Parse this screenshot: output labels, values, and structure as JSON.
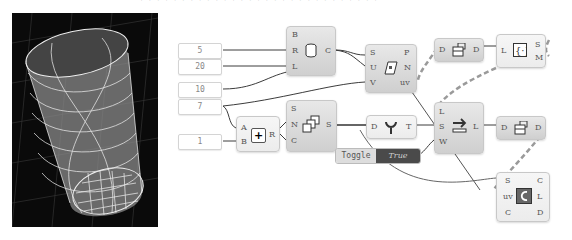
{
  "header": {
    "clipped_caption": "· · · · · · ·  ·  · · · · · · · · · · · · · · · · · · · · ·"
  },
  "viewport": {
    "label": "3D preview",
    "background": "#0a0a0a",
    "wire_color": "#e6e6e6"
  },
  "number_inputs": [
    {
      "value": "5"
    },
    {
      "value": "20"
    },
    {
      "value": "10"
    },
    {
      "value": "7"
    },
    {
      "value": "1"
    }
  ],
  "components": {
    "cylinder": {
      "inputs": [
        "B",
        "R",
        "L"
      ],
      "outputs": [
        "C"
      ],
      "icon": "cylinder-icon"
    },
    "surface_divide": {
      "inputs": [
        "S",
        "U",
        "V"
      ],
      "outputs": [
        "P",
        "N",
        "uv"
      ],
      "icon": "divide-surface-icon"
    },
    "addition": {
      "inputs": [
        "A",
        "B"
      ],
      "outputs": [
        "R"
      ],
      "icon": "plus-icon"
    },
    "series": {
      "inputs": [
        "S",
        "N",
        "C"
      ],
      "outputs": [
        "S"
      ],
      "icon": "series-icon"
    },
    "graft": {
      "inputs": [
        "D"
      ],
      "outputs": [
        "T"
      ],
      "icon": "graft-tree-icon"
    },
    "shift_list": {
      "inputs": [
        "L",
        "S",
        "W"
      ],
      "outputs": [
        "L"
      ],
      "icon": "shift-list-icon"
    },
    "flip_matrix_top": {
      "inputs": [
        "D"
      ],
      "outputs": [
        "D"
      ],
      "icon": "flip-matrix-icon"
    },
    "list_length": {
      "inputs": [
        "L"
      ],
      "outputs": [
        "S",
        "M"
      ],
      "icon": "list-brackets-icon"
    },
    "flip_matrix_mid": {
      "inputs": [
        "D"
      ],
      "outputs": [
        "D"
      ],
      "icon": "flip-matrix-icon"
    },
    "curve_on_surface": {
      "inputs": [
        "S",
        "uv",
        "C"
      ],
      "outputs": [
        "C",
        "L",
        "D"
      ],
      "icon": "curve-on-surface-icon"
    }
  },
  "toggle": {
    "label": "Toggle",
    "value": "True"
  }
}
